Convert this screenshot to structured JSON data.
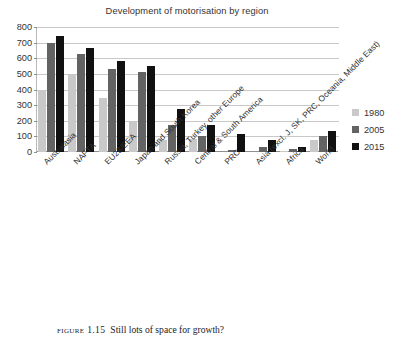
{
  "figure": {
    "caption_number": "Figure 1.15",
    "caption_text": "Still lots of space for growth?"
  },
  "chart_data": {
    "type": "bar",
    "title": "Development of motorisation by region",
    "xlabel": "",
    "ylabel": "",
    "ylim": [
      0,
      800
    ],
    "yticks": [
      0,
      100,
      200,
      300,
      400,
      500,
      600,
      700,
      800
    ],
    "ytick_labels": [
      "0",
      "100",
      "200",
      "300",
      "400",
      "500",
      "600",
      "700",
      "800"
    ],
    "grid": true,
    "legend_position": "right",
    "categories": [
      "Australasia",
      "NAFTA",
      "EU28/EEA",
      "Japan and South Korea",
      "Russia, Turkey, other Europe",
      "Central & South America",
      "PRC",
      "Asia (excl. J, SK, PRC, Oceania, Middle East)",
      "Africa",
      "World"
    ],
    "series": [
      {
        "name": "1980",
        "color": "#c9c9c9",
        "values": [
          400,
          500,
          345,
          190,
          75,
          85,
          0,
          0,
          5,
          75
        ]
      },
      {
        "name": "2005",
        "color": "#636363",
        "values": [
          700,
          630,
          530,
          510,
          172,
          105,
          13,
          30,
          20,
          105
        ]
      },
      {
        "name": "2015",
        "color": "#111111",
        "values": [
          740,
          665,
          580,
          550,
          278,
          172,
          115,
          80,
          33,
          137
        ]
      }
    ]
  }
}
